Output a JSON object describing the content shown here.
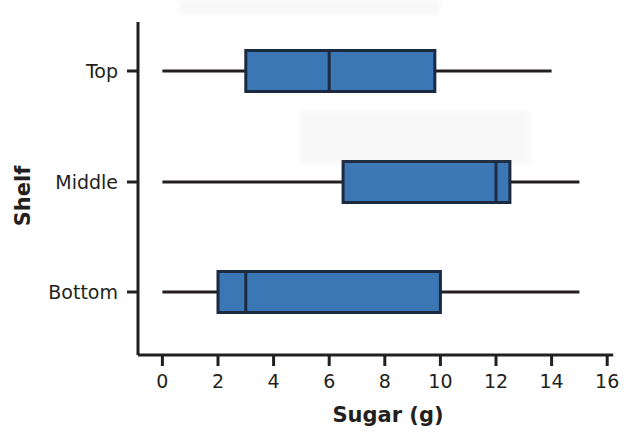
{
  "chart_data": {
    "type": "box",
    "title": "",
    "xlabel": "Sugar (g)",
    "ylabel": "Shelf",
    "orientation": "horizontal",
    "grid": false,
    "legend": "none",
    "xlim": [
      0,
      16
    ],
    "xticks": [
      0,
      2,
      4,
      6,
      8,
      10,
      12,
      14,
      16
    ],
    "xtick_labels": [
      "0",
      "2",
      "4",
      "6",
      "8",
      "10",
      "12",
      "14",
      "16"
    ],
    "categories": [
      "Top",
      "Middle",
      "Bottom"
    ],
    "boxes": [
      {
        "category": "Top",
        "min": 0,
        "q1": 3,
        "median": 6,
        "q3": 9.8,
        "max": 14
      },
      {
        "category": "Middle",
        "min": 0,
        "q1": 6.5,
        "median": 12,
        "q3": 12.5,
        "max": 15
      },
      {
        "category": "Bottom",
        "min": 0,
        "q1": 2,
        "median": 3,
        "q3": 10,
        "max": 15
      }
    ],
    "colors": {
      "box_fill": "#3C77B5",
      "box_border": "#1b2a40",
      "whisker": "#231f20",
      "axis": "#231f20",
      "text": "#231f20",
      "background": "#ffffff"
    }
  },
  "geometry": {
    "x_zero_px": 162.4,
    "px_per_unit": 27.8,
    "axis_x_px": 138,
    "axis_top_px": 22,
    "axis_bottom_px": 355,
    "row_centers_px": [
      71,
      182,
      292
    ],
    "box_height_px": 41
  }
}
